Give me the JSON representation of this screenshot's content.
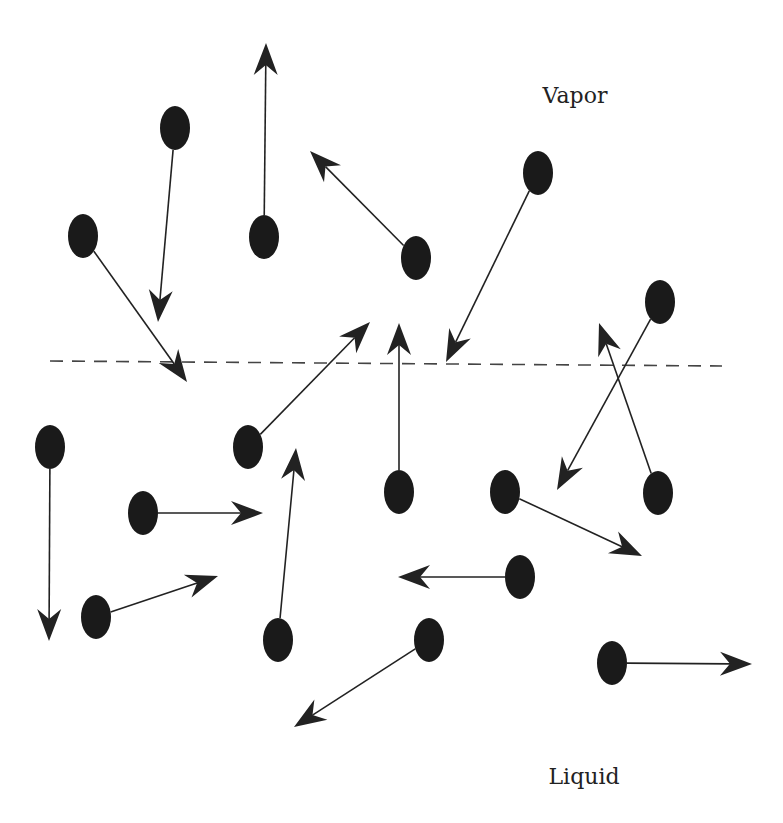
{
  "labels": {
    "vapor": {
      "text": "Vapor",
      "x": 575,
      "y": 95
    },
    "liquid": {
      "text": "Liquid",
      "x": 584,
      "y": 776
    }
  },
  "interface": {
    "x1": 50,
    "y1": 361,
    "x2": 722,
    "y2": 366,
    "style": "dashed"
  },
  "colors": {
    "molecule": "#1a1a1a",
    "arrow": "#222222",
    "interface": "#444444"
  },
  "molecules": [
    {
      "cx": 83,
      "cy": 236,
      "tx": 187,
      "ty": 382,
      "phase": "vapor"
    },
    {
      "cx": 175,
      "cy": 128,
      "tx": 158,
      "ty": 322,
      "phase": "vapor"
    },
    {
      "cx": 264,
      "cy": 237,
      "tx": 266,
      "ty": 43,
      "phase": "vapor"
    },
    {
      "cx": 416,
      "cy": 258,
      "tx": 310,
      "ty": 151,
      "phase": "vapor"
    },
    {
      "cx": 538,
      "cy": 173,
      "tx": 446,
      "ty": 362,
      "phase": "vapor"
    },
    {
      "cx": 660,
      "cy": 302,
      "tx": 557,
      "ty": 490,
      "phase": "vapor"
    },
    {
      "cx": 658,
      "cy": 493,
      "tx": 599,
      "ty": 323,
      "phase": "liquid"
    },
    {
      "cx": 50,
      "cy": 447,
      "tx": 49,
      "ty": 641,
      "phase": "liquid"
    },
    {
      "cx": 248,
      "cy": 447,
      "tx": 370,
      "ty": 322,
      "phase": "liquid"
    },
    {
      "cx": 143,
      "cy": 513,
      "tx": 263,
      "ty": 513,
      "phase": "liquid"
    },
    {
      "cx": 96,
      "cy": 617,
      "tx": 218,
      "ty": 576,
      "phase": "liquid"
    },
    {
      "cx": 278,
      "cy": 640,
      "tx": 296,
      "ty": 448,
      "phase": "liquid"
    },
    {
      "cx": 399,
      "cy": 492,
      "tx": 399,
      "ty": 323,
      "phase": "liquid"
    },
    {
      "cx": 505,
      "cy": 492,
      "tx": 642,
      "ty": 556,
      "phase": "liquid"
    },
    {
      "cx": 520,
      "cy": 577,
      "tx": 398,
      "ty": 577,
      "phase": "liquid"
    },
    {
      "cx": 429,
      "cy": 640,
      "tx": 294,
      "ty": 727,
      "phase": "liquid"
    },
    {
      "cx": 612,
      "cy": 663,
      "tx": 752,
      "ty": 664,
      "phase": "liquid"
    }
  ]
}
